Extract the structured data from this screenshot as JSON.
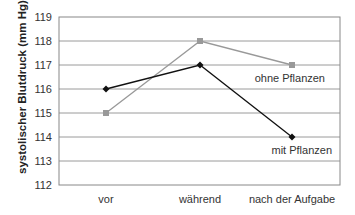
{
  "chart_data": {
    "type": "line",
    "title": "",
    "xlabel": "",
    "ylabel": "systolischer Blutdruck (mm Hg)",
    "categories": [
      "vor",
      "während",
      "nach der Aufgabe"
    ],
    "series": [
      {
        "name": "mit Pflanzen",
        "values": [
          116,
          117,
          114
        ],
        "color": "#111111",
        "marker": "diamond"
      },
      {
        "name": "ohne Pflanzen",
        "values": [
          115,
          118,
          117
        ],
        "color": "#999999",
        "marker": "square"
      }
    ],
    "ylim": [
      112,
      119
    ],
    "yticks": [
      112,
      113,
      114,
      115,
      116,
      117,
      118,
      119
    ],
    "grid": true,
    "legend_position": "inline labels near last points",
    "annotations": [
      {
        "text": "ohne Pflanzen",
        "near": "nach der Aufgabe",
        "value": 117
      },
      {
        "text": "mit Pflanzen",
        "near": "nach der Aufgabe",
        "value": 114
      }
    ]
  }
}
